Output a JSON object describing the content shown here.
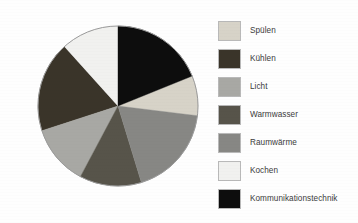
{
  "chart_data": {
    "type": "pie",
    "title": "",
    "subtitle": "",
    "xlabel": "",
    "ylabel": "",
    "legend_position": "right",
    "grid": false,
    "categories": [
      "Spülen",
      "Kühlen",
      "Licht",
      "Warmwasser",
      "Raumwärme",
      "Kochen",
      "Kommunikationstechnik"
    ],
    "values": [
      8,
      18,
      12,
      13,
      18,
      12,
      19
    ],
    "colors": [
      "#d7d3c8",
      "#3a3429",
      "#a8a8a4",
      "#57544a",
      "#878784",
      "#f1f1ef",
      "#0d0d0d"
    ],
    "slices": [
      {
        "label": "Spülen",
        "value": 8,
        "percent": 8,
        "color": "#d7d3c8",
        "start_deg": 68,
        "end_deg": 97
      },
      {
        "label": "Kühlen",
        "value": 18,
        "percent": 18,
        "color": "#3a3429",
        "start_deg": 252,
        "end_deg": 318
      },
      {
        "label": "Licht",
        "value": 12,
        "percent": 12,
        "color": "#a8a8a4",
        "start_deg": 208,
        "end_deg": 252
      },
      {
        "label": "Warmwasser",
        "value": 13,
        "percent": 13,
        "color": "#57544a",
        "start_deg": 163,
        "end_deg": 208
      },
      {
        "label": "Raumwärme",
        "value": 18,
        "percent": 18,
        "color": "#878784",
        "start_deg": 97,
        "end_deg": 163
      },
      {
        "label": "Kochen",
        "value": 12,
        "percent": 12,
        "color": "#f1f1ef",
        "start_deg": 318,
        "end_deg": 360
      },
      {
        "label": "Kommunikationstechnik",
        "value": 19,
        "percent": 19,
        "color": "#0d0d0d",
        "start_deg": 0,
        "end_deg": 68
      }
    ],
    "geometry": {
      "center_x": 118,
      "center_y": 106,
      "radius": 80,
      "start_angle_deg": 0,
      "direction": "clockwise"
    }
  },
  "legend": {
    "items": [
      {
        "label": "Spülen",
        "color": "#d7d3c8"
      },
      {
        "label": "Kühlen",
        "color": "#3a3429"
      },
      {
        "label": "Licht",
        "color": "#a8a8a4"
      },
      {
        "label": "Warmwasser",
        "color": "#57544a"
      },
      {
        "label": "Raumwärme",
        "color": "#878784"
      },
      {
        "label": "Kochen",
        "color": "#f1f1ef"
      },
      {
        "label": "Kommunikationstechnik",
        "color": "#0d0d0d"
      }
    ]
  },
  "page": {
    "background": "#fefefe",
    "outline_color": "#9a9a9a"
  }
}
